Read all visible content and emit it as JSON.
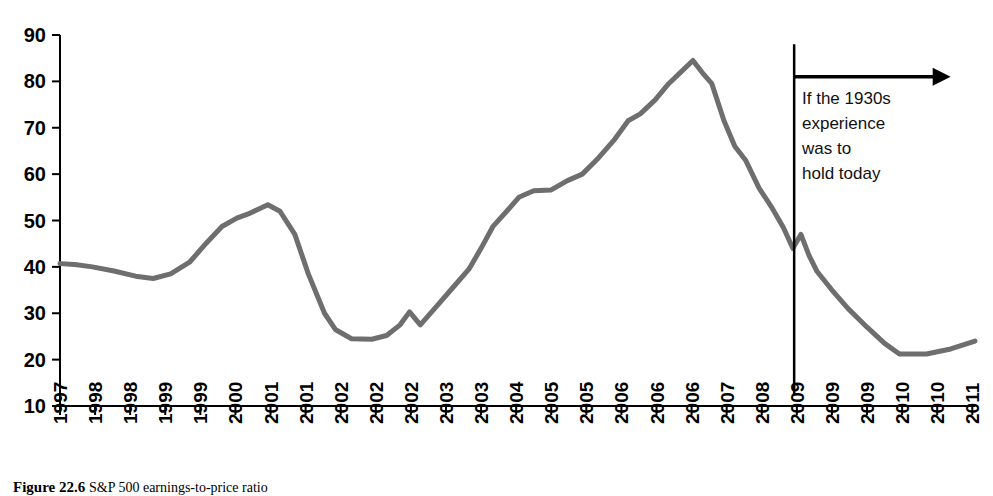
{
  "figure": {
    "caption_label": "Figure 22.6",
    "caption_body": "S&P 500 earnings-to-price ratio"
  },
  "annotation": {
    "lines": [
      "If the 1930s",
      "experience",
      "was to",
      "hold today"
    ],
    "marker_name": "projection-divider"
  },
  "chart_data": {
    "type": "line",
    "title": "",
    "xlabel": "",
    "ylabel": "",
    "ylim": [
      10,
      90
    ],
    "yticks": [
      10,
      20,
      30,
      40,
      50,
      60,
      70,
      80,
      90
    ],
    "grid": false,
    "legend": "none",
    "line_color": "#6e6e6e",
    "line_width": 5,
    "categories": [
      "1997",
      "1998",
      "1998",
      "1999",
      "1999",
      "2000",
      "2001",
      "2001",
      "2002",
      "2002",
      "2002",
      "2003",
      "2003",
      "2004",
      "2005",
      "2005",
      "2006",
      "2006",
      "2006",
      "2007",
      "2008",
      "2009",
      "2009",
      "2009",
      "2010",
      "2010",
      "2011"
    ],
    "x": [
      0,
      1,
      2,
      3,
      4,
      5,
      6,
      7,
      8,
      9,
      10,
      11,
      12,
      13,
      14,
      15,
      16,
      17,
      18,
      19,
      20,
      21,
      22,
      23,
      24,
      25,
      26
    ],
    "series": [
      {
        "name": "S&P 500 earnings-to-price ratio",
        "values": [
          40.7,
          40.3,
          39.2,
          37.6,
          38.4,
          43.0,
          49.8,
          53.4,
          50.8,
          42.0,
          27.0,
          24.4,
          24.6,
          30.3,
          27.5,
          38.5,
          48.8,
          53.5,
          56.4,
          56.6,
          58.9,
          61.2,
          65.6,
          70.0,
          73.0,
          75.6,
          79.3
        ]
      }
    ],
    "detail_points": [
      {
        "year_index": 0.0,
        "value": 40.7
      },
      {
        "year_index": 0.55,
        "value": 40.5
      },
      {
        "year_index": 1.2,
        "value": 40.0
      },
      {
        "year_index": 2.0,
        "value": 39.1
      },
      {
        "year_index": 2.8,
        "value": 38.0
      },
      {
        "year_index": 3.45,
        "value": 37.5
      },
      {
        "year_index": 4.1,
        "value": 38.5
      },
      {
        "year_index": 4.8,
        "value": 41.0
      },
      {
        "year_index": 5.4,
        "value": 45.0
      },
      {
        "year_index": 6.0,
        "value": 48.7
      },
      {
        "year_index": 6.55,
        "value": 50.5
      },
      {
        "year_index": 7.05,
        "value": 51.6
      },
      {
        "year_index": 7.7,
        "value": 53.4
      },
      {
        "year_index": 8.15,
        "value": 52.0
      },
      {
        "year_index": 8.7,
        "value": 47.0
      },
      {
        "year_index": 9.2,
        "value": 38.5
      },
      {
        "year_index": 9.8,
        "value": 30.0
      },
      {
        "year_index": 10.2,
        "value": 26.5
      },
      {
        "year_index": 10.8,
        "value": 24.5
      },
      {
        "year_index": 11.55,
        "value": 24.4
      },
      {
        "year_index": 12.1,
        "value": 25.2
      },
      {
        "year_index": 12.6,
        "value": 27.5
      },
      {
        "year_index": 12.95,
        "value": 30.3
      },
      {
        "year_index": 13.35,
        "value": 27.5
      },
      {
        "year_index": 13.95,
        "value": 31.5
      },
      {
        "year_index": 14.55,
        "value": 35.5
      },
      {
        "year_index": 15.15,
        "value": 39.5
      },
      {
        "year_index": 15.6,
        "value": 44.0
      },
      {
        "year_index": 16.05,
        "value": 48.8
      },
      {
        "year_index": 16.55,
        "value": 52.0
      },
      {
        "year_index": 17.0,
        "value": 55.0
      },
      {
        "year_index": 17.55,
        "value": 56.4
      },
      {
        "year_index": 18.2,
        "value": 56.6
      },
      {
        "year_index": 18.8,
        "value": 58.6
      },
      {
        "year_index": 19.35,
        "value": 60.0
      },
      {
        "year_index": 19.95,
        "value": 63.5
      },
      {
        "year_index": 20.55,
        "value": 67.5
      },
      {
        "year_index": 21.05,
        "value": 71.5
      },
      {
        "year_index": 21.5,
        "value": 73.0
      },
      {
        "year_index": 22.05,
        "value": 76.0
      },
      {
        "year_index": 22.55,
        "value": 79.5
      },
      {
        "year_index": 23.0,
        "value": 82.0
      },
      {
        "year_index": 23.45,
        "value": 84.5
      },
      {
        "year_index": 23.85,
        "value": 81.5
      },
      {
        "year_index": 24.15,
        "value": 79.5
      },
      {
        "year_index": 24.6,
        "value": 71.5
      },
      {
        "year_index": 25.0,
        "value": 66.0
      },
      {
        "year_index": 25.4,
        "value": 63.0
      },
      {
        "year_index": 25.9,
        "value": 57.0
      },
      {
        "year_index": 26.35,
        "value": 53.0
      },
      {
        "year_index": 26.8,
        "value": 48.5
      },
      {
        "year_index": 27.15,
        "value": 44.0
      },
      {
        "year_index": 27.45,
        "value": 47.0
      },
      {
        "year_index": 27.75,
        "value": 42.5
      },
      {
        "year_index": 28.05,
        "value": 39.0
      },
      {
        "year_index": 28.6,
        "value": 35.0
      },
      {
        "year_index": 29.2,
        "value": 31.0
      },
      {
        "year_index": 29.9,
        "value": 27.0
      },
      {
        "year_index": 30.55,
        "value": 23.5
      },
      {
        "year_index": 31.1,
        "value": 21.2
      },
      {
        "year_index": 32.1,
        "value": 21.2
      },
      {
        "year_index": 33.0,
        "value": 22.3
      },
      {
        "year_index": 33.9,
        "value": 24.0
      }
    ],
    "annotations": [
      {
        "type": "vline",
        "label": "projection-start",
        "x_index": 27.2,
        "y_from": 12.5,
        "y_to": 88.0
      },
      {
        "type": "arrow",
        "label": "forward-projection-arrow",
        "x_from": 27.2,
        "x_to": 33.0,
        "y": 81.0
      }
    ],
    "xtick_indices": [
      0.0,
      1.3,
      2.6,
      3.9,
      5.2,
      6.5,
      7.8,
      9.1,
      10.4,
      11.7,
      13.0,
      14.3,
      15.6,
      16.9,
      18.2,
      19.5,
      20.8,
      22.1,
      23.4,
      24.7,
      26.0,
      27.3,
      28.6,
      29.9,
      31.2,
      32.5,
      33.8
    ]
  }
}
